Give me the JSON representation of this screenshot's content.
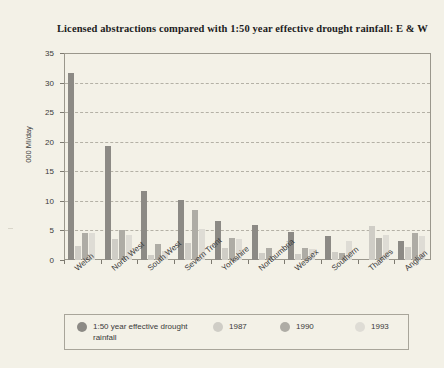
{
  "chart_data": {
    "type": "bar",
    "title": "Licensed abstractions compared with 1:50 year effective drought rainfall: E & W",
    "xlabel": "",
    "ylabel": "000 Ml/day",
    "ylim": [
      0,
      35
    ],
    "ytick_step": 5,
    "yticks": [
      "0",
      "5",
      "10",
      "15",
      "20",
      "25",
      "30",
      "35"
    ],
    "grid": true,
    "legend_position": "bottom",
    "categories": [
      "Welsh",
      "North West",
      "South West",
      "Severn Trent",
      "Yorkshire",
      "Northumbria",
      "Wessex",
      "Southern",
      "Thames",
      "Anglian"
    ],
    "series": [
      {
        "name": "1:50 year effective drought rainfall",
        "color": "#8c8a85",
        "values": [
          31.7,
          19.3,
          11.7,
          10.1,
          6.6,
          6.0,
          4.8,
          4.0,
          0.0,
          3.2
        ]
      },
      {
        "name": "1987",
        "color": "#cfcdc6",
        "values": [
          2.4,
          3.6,
          0.8,
          2.9,
          2.1,
          1.2,
          1.0,
          1.4,
          5.7,
          2.2
        ]
      },
      {
        "name": "1990",
        "color": "#aeaca5",
        "values": [
          4.6,
          5.0,
          2.7,
          8.4,
          3.7,
          2.0,
          2.1,
          1.2,
          3.7,
          4.6
        ]
      },
      {
        "name": "1993",
        "color": "#dedcd5",
        "values": [
          4.6,
          4.2,
          1.5,
          5.3,
          3.5,
          0.0,
          1.8,
          3.2,
          4.3,
          4.0
        ]
      }
    ]
  },
  "legend": {
    "entries": [
      "1:50 year effective drought rainfall",
      "1987",
      "1990",
      "1993"
    ]
  },
  "colors": {
    "background": "#f3f1e7",
    "frame": "#9a978c",
    "gridline": "#b4b1a6",
    "text": "#3a3a3a",
    "title": "#1d1d1d"
  }
}
